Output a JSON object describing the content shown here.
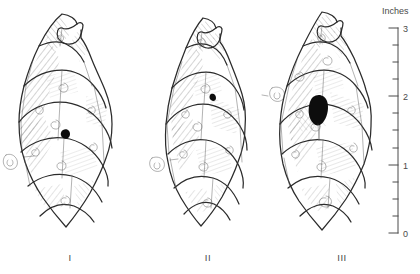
{
  "figure": {
    "title": "",
    "background_color": "#ffffff",
    "ink_color": "#2b2b2b",
    "hole_color": "#0d0d0d"
  },
  "scale": {
    "title": "Inches",
    "unit": "inches",
    "min": 0,
    "max": 3,
    "major_labels": [
      "3",
      "2",
      "1",
      "0"
    ],
    "major_values": [
      3,
      2,
      1,
      0
    ],
    "minor_tick_interval": 0.25,
    "axis_top_y": 28,
    "axis_bottom_y": 233,
    "axis_x": 398
  },
  "specimens": [
    {
      "label": "I",
      "label_x": 70,
      "label_y": 261,
      "damage": {
        "name": "insect-exit-hole",
        "size": "small",
        "center_x": 66,
        "center_y": 133
      }
    },
    {
      "label": "II",
      "label_x": 208,
      "label_y": 261,
      "damage": {
        "name": "insect-exit-hole",
        "size": "small",
        "center_x": 213,
        "center_y": 97
      }
    },
    {
      "label": "III",
      "label_x": 342,
      "label_y": 261,
      "damage": {
        "name": "insect-exit-hole",
        "size": "large",
        "center_x": 317,
        "center_y": 110
      }
    }
  ]
}
